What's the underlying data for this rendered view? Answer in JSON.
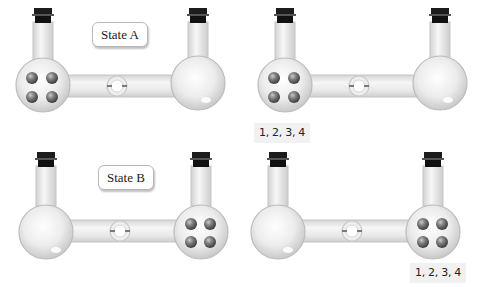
{
  "panels": [
    {
      "id": "state-a-initial",
      "label": "State A",
      "balls_in": "left",
      "ball_count": 4,
      "caption": null
    },
    {
      "id": "state-a-result",
      "label": null,
      "balls_in": "left",
      "ball_count": 4,
      "caption": "1, 2, 3, 4"
    },
    {
      "id": "state-b-initial",
      "label": "State B",
      "balls_in": "right",
      "ball_count": 4,
      "caption": null
    },
    {
      "id": "state-b-result",
      "label": null,
      "balls_in": "right",
      "ball_count": 4,
      "caption": "1, 2, 3, 4"
    }
  ],
  "labels": {
    "state_a": "State A",
    "state_b": "State B",
    "caption_a": "1, 2, 3, 4",
    "caption_b": "1, 2, 3, 4"
  },
  "colors": {
    "glass": "#e6e6e6",
    "glass_edge": "#c4c4c4",
    "stopper": "#1a1a1a",
    "ball": "#7a7a7a",
    "caption_bg": "#f1f1f1"
  },
  "icons": {
    "flask": "round-bottom-flask-icon",
    "stopper": "stopper-icon",
    "valve": "stopcock-valve-icon",
    "particle": "gas-particle-icon"
  }
}
